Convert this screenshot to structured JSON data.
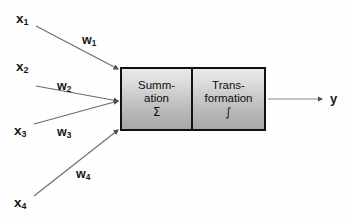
{
  "diagram": {
    "inputs": [
      {
        "name": "x1",
        "base": "x",
        "sub": "1",
        "x": 16,
        "y": 12,
        "weight": {
          "base": "w",
          "sub": "1",
          "x": 82,
          "y": 34
        },
        "line": {
          "x1": 36,
          "y1": 26,
          "x2": 118,
          "y2": 69
        }
      },
      {
        "name": "x2",
        "base": "x",
        "sub": "2",
        "x": 16,
        "y": 60,
        "weight": {
          "base": "w",
          "sub": "2",
          "x": 57,
          "y": 80
        },
        "line": {
          "x1": 36,
          "y1": 86,
          "x2": 118,
          "y2": 101
        }
      },
      {
        "name": "x3",
        "base": "x",
        "sub": "3",
        "x": 14,
        "y": 124,
        "weight": {
          "base": "w",
          "sub": "3",
          "x": 57,
          "y": 126
        },
        "line": {
          "x1": 34,
          "y1": 124,
          "x2": 118,
          "y2": 101
        }
      },
      {
        "name": "x4",
        "base": "x",
        "sub": "4",
        "x": 14,
        "y": 196,
        "weight": {
          "base": "w",
          "sub": "4",
          "x": 76,
          "y": 168
        },
        "line": {
          "x1": 34,
          "y1": 196,
          "x2": 118,
          "y2": 130
        }
      }
    ],
    "neuron": {
      "summation": {
        "lines": [
          "Summ-",
          "ation"
        ],
        "symbol": "Σ"
      },
      "transformation": {
        "lines": [
          "Trans-",
          "formation"
        ],
        "symbol": "∫"
      }
    },
    "output": {
      "label": {
        "base": "y",
        "sub": "",
        "x": 330,
        "y": 92
      },
      "line": {
        "x1": 268,
        "y1": 99,
        "x2": 324,
        "y2": 99
      }
    },
    "colors": {
      "stroke": "#6b6b6b",
      "box_border": "#111111",
      "text": "#171717",
      "background": "#fefefe",
      "fill_top": "#e9e9e9",
      "fill_bottom": "#a8a8a8"
    }
  }
}
